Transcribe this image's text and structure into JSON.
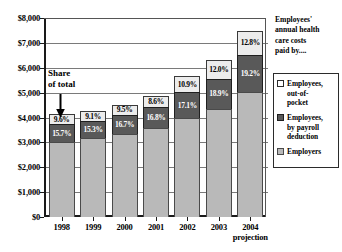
{
  "chart_data": {
    "type": "bar",
    "subtype": "stacked-column",
    "xlabel": "",
    "ylabel": "",
    "ylim": [
      0,
      8000
    ],
    "ytick_step": 1000,
    "grid": true,
    "legend_position": "right",
    "categories": [
      "1998",
      "1999",
      "2000",
      "2001",
      "2002",
      "2003",
      "2004 projection"
    ],
    "category_lines": [
      [
        "1998"
      ],
      [
        "1999"
      ],
      [
        "2000"
      ],
      [
        "2001"
      ],
      [
        "2002"
      ],
      [
        "2003"
      ],
      [
        "2004",
        "projection"
      ]
    ],
    "series": [
      {
        "name": "Employers",
        "key": "employer",
        "color": "#b9b9b9",
        "values": [
          3025,
          3165,
          3330,
          3565,
          3980,
          4345,
          5040
        ],
        "labels": [
          "",
          "",
          "",
          "",
          "",
          "",
          ""
        ]
      },
      {
        "name": "Employees, by payroll deduction",
        "key": "payroll",
        "color": "#595959",
        "values": [
          700,
          690,
          760,
          855,
          1030,
          1215,
          1470
        ],
        "labels": [
          "15.7%",
          "15.3%",
          "16.7%",
          "16.8%",
          "17.1%",
          "18.9%",
          "19.2%"
        ]
      },
      {
        "name": "Employees, out-of-pocket",
        "key": "oop",
        "color": "#ececec",
        "values": [
          430,
          410,
          430,
          440,
          655,
          770,
          980
        ],
        "labels": [
          "9.6%",
          "9.1%",
          "9.5%",
          "8.6%",
          "10.9%",
          "12.0%",
          "12.8%"
        ]
      }
    ],
    "totals": [
      4155,
      4265,
      4520,
      4860,
      5665,
      6330,
      7490
    ],
    "ytick_labels": [
      "$0",
      "$1,000",
      "$2,000",
      "$3,000",
      "$4,000",
      "$5,000",
      "$6,000",
      "$7,000",
      "$8,000"
    ],
    "annotation": {
      "line1": "Share",
      "line2": "of total",
      "arrow": "down-arrow"
    }
  },
  "legend": {
    "items": [
      {
        "label_lines": [
          "Employees,",
          "out-of-",
          "pocket"
        ],
        "swatch": "sw-oop"
      },
      {
        "label_lines": [
          "Employees,",
          "by payroll",
          "deduction"
        ],
        "swatch": "sw-payroll"
      },
      {
        "label_lines": [
          "Employers"
        ],
        "swatch": "sw-employer"
      }
    ]
  },
  "caption": {
    "lines": [
      "Employees'",
      "annual health",
      "care costs",
      "paid by...."
    ]
  },
  "colors": {
    "employer": "#b9b9b9",
    "payroll": "#595959",
    "out_of_pocket": "#ececec",
    "axis": "#1a1a1a",
    "grid": "#7a7a7a"
  }
}
